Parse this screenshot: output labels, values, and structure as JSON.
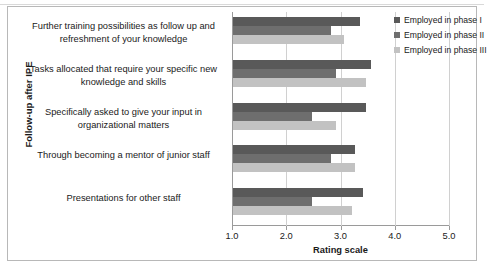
{
  "chart_data": {
    "type": "bar",
    "orientation": "horizontal",
    "title": "",
    "xlabel": "Rating scale",
    "ylabel": "Follow-up after IPE",
    "xlim": [
      1.0,
      5.0
    ],
    "xticks": [
      "1.0",
      "2.0",
      "3.0",
      "4.0",
      "5.0"
    ],
    "xtick_values": [
      1.0,
      2.0,
      3.0,
      4.0,
      5.0
    ],
    "grid": true,
    "legend_position": "top-right",
    "categories": [
      "Further training possibilities as follow up and refreshment of your knowledge",
      "Tasks allocated that require your specific new knowledge and skills",
      "Specifically asked to give your input in organizational matters",
      "Through becoming a mentor of junior staff",
      "Presentations for other staff"
    ],
    "series": [
      {
        "name": "Employed in phase I",
        "color": "#595959",
        "values": [
          3.35,
          3.55,
          3.45,
          3.25,
          3.4
        ]
      },
      {
        "name": "Employed in phase II",
        "color": "#6e6e6e",
        "values": [
          2.8,
          2.9,
          2.45,
          2.8,
          2.45
        ]
      },
      {
        "name": "Employed in phase III",
        "color": "#c2c2c2",
        "values": [
          3.05,
          3.45,
          2.9,
          3.25,
          3.2
        ]
      }
    ]
  }
}
